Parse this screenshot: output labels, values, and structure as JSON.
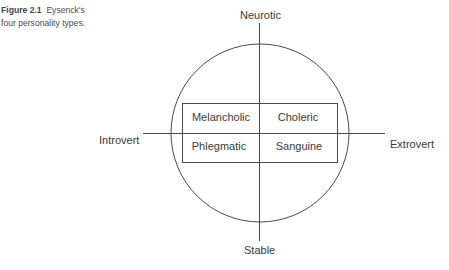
{
  "caption": {
    "figure_label": "Figure 2.1",
    "line1_rest": "Eysenck's",
    "line2": "four personality types."
  },
  "axes": {
    "top": "Neurotic",
    "bottom": "Stable",
    "left": "Introvert",
    "right": "Extrovert"
  },
  "quadrants": {
    "top_left": "Melancholic",
    "top_right": "Choleric",
    "bottom_left": "Phlegmatic",
    "bottom_right": "Sanguine"
  },
  "colors": {
    "line": "#4a4a4a",
    "text": "#3a3a3a"
  }
}
